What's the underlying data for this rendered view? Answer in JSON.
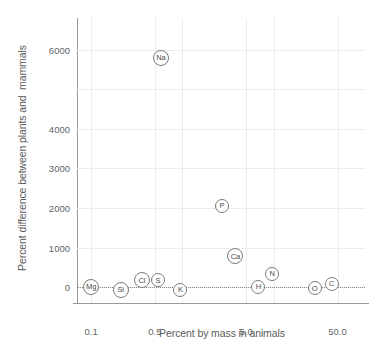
{
  "chart_data": {
    "type": "scatter",
    "title": "",
    "xlabel": "Percent by mass in animals",
    "ylabel": "Percent difference between plants and  mammals",
    "xscale": "log",
    "yscale": "linear",
    "grid": true,
    "legend": false,
    "xlim": [
      0.07,
      100.0
    ],
    "ylim": [
      -400,
      6800
    ],
    "xticks": [
      "0.1",
      "0.5",
      "5.0",
      "50.0"
    ],
    "xtick_values": [
      0.1,
      0.5,
      5.0,
      50.0
    ],
    "yticks": [
      "0",
      "1000",
      "2000",
      "3000",
      "4000",
      "6000"
    ],
    "ytick_values": [
      0,
      1000,
      2000,
      3000,
      4000,
      6000
    ],
    "point_label_key": "element",
    "points": [
      {
        "element": "Mg",
        "x": 0.1,
        "y": 0
      },
      {
        "element": "Si",
        "x": 0.21,
        "y": -60
      },
      {
        "element": "Cl",
        "x": 0.36,
        "y": 170
      },
      {
        "element": "S",
        "x": 0.54,
        "y": 170
      },
      {
        "element": "K",
        "x": 0.95,
        "y": -60
      },
      {
        "element": "Na",
        "x": 0.58,
        "y": 5800
      },
      {
        "element": "P",
        "x": 2.7,
        "y": 2050
      },
      {
        "element": "Ca",
        "x": 3.8,
        "y": 780
      },
      {
        "element": "H",
        "x": 6.8,
        "y": 0
      },
      {
        "element": "N",
        "x": 9.6,
        "y": 330
      },
      {
        "element": "O",
        "x": 28.0,
        "y": -30
      },
      {
        "element": "C",
        "x": 43.0,
        "y": 90
      }
    ]
  },
  "axis": {
    "x_title": "Percent by mass in animals",
    "y_title": "Percent difference between plants and  mammals"
  }
}
